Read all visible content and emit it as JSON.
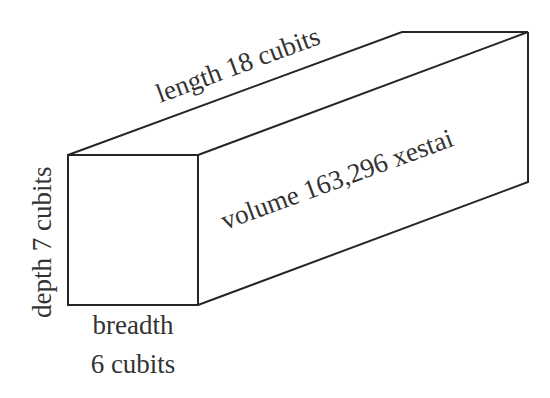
{
  "diagram": {
    "type": "box-prism",
    "labels": {
      "length": "length 18 cubits",
      "volume": "volume 163,296 xestai",
      "depth": "depth 7 cubits",
      "breadth_line1": "breadth",
      "breadth_line2": "6 cubits"
    },
    "dimensions": {
      "length": {
        "value": 18,
        "unit": "cubits"
      },
      "breadth": {
        "value": 6,
        "unit": "cubits"
      },
      "depth": {
        "value": 7,
        "unit": "cubits"
      },
      "volume": {
        "value": 163296,
        "unit": "xestai"
      }
    },
    "colors": {
      "stroke": "#262626",
      "text": "#333333",
      "background": "#ffffff"
    }
  }
}
